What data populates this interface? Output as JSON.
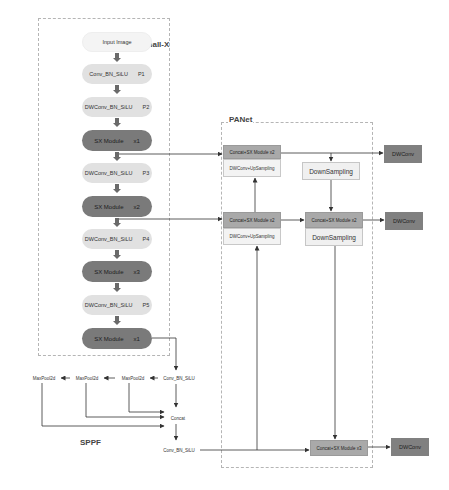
{
  "groups": {
    "backbone": {
      "label": "Small-X"
    },
    "neck": {
      "label": "PANet"
    },
    "spp": {
      "label": "SPPF"
    }
  },
  "backbone": {
    "nodes": [
      {
        "name": "Input Image",
        "suffix": ""
      },
      {
        "name": "Conv_BN_SiLU",
        "suffix": "P1"
      },
      {
        "name": "DWConv_BN_SiLU",
        "suffix": "P2"
      },
      {
        "name": "SX Module",
        "suffix": "x1"
      },
      {
        "name": "DWConv_BN_SiLU",
        "suffix": "P3"
      },
      {
        "name": "SX Module",
        "suffix": "x2"
      },
      {
        "name": "DWConv_BN_SiLU",
        "suffix": "P4"
      },
      {
        "name": "SX Module",
        "suffix": "x3"
      },
      {
        "name": "DWConv_BN_SiLU",
        "suffix": "P5"
      },
      {
        "name": "SX Module",
        "suffix": "x1"
      }
    ]
  },
  "sppf": {
    "conv_in": "Conv_BN_SiLU",
    "maxpools": [
      "MaxPool2d",
      "MaxPool2d",
      "MaxPool2d"
    ],
    "concat": "Concat",
    "conv_out": "Conv_BN_SiLU"
  },
  "panet": {
    "top_concat": "Concat+SX Module x2",
    "top_upsample": "DWConv+UpSampling",
    "top_downsample": "DownSampling",
    "mid_concat_left": "Concat+SX Module x2",
    "mid_upsample": "DWConv+UpSampling",
    "mid_concat_right": "Concat+SX Module x2",
    "mid_downsample": "DownSampling",
    "bottom_concat": "Concat+SX Module x3"
  },
  "outputs": [
    "DWConv",
    "DWConv",
    "DWConv"
  ],
  "colors": {
    "dark_pill": "#7a7a7a",
    "light_pill": "#e1e1e1",
    "concat_box": "#a9a9a9",
    "output_box": "#808080",
    "dashed_border": "#b5b5b5",
    "line": "#333333"
  }
}
